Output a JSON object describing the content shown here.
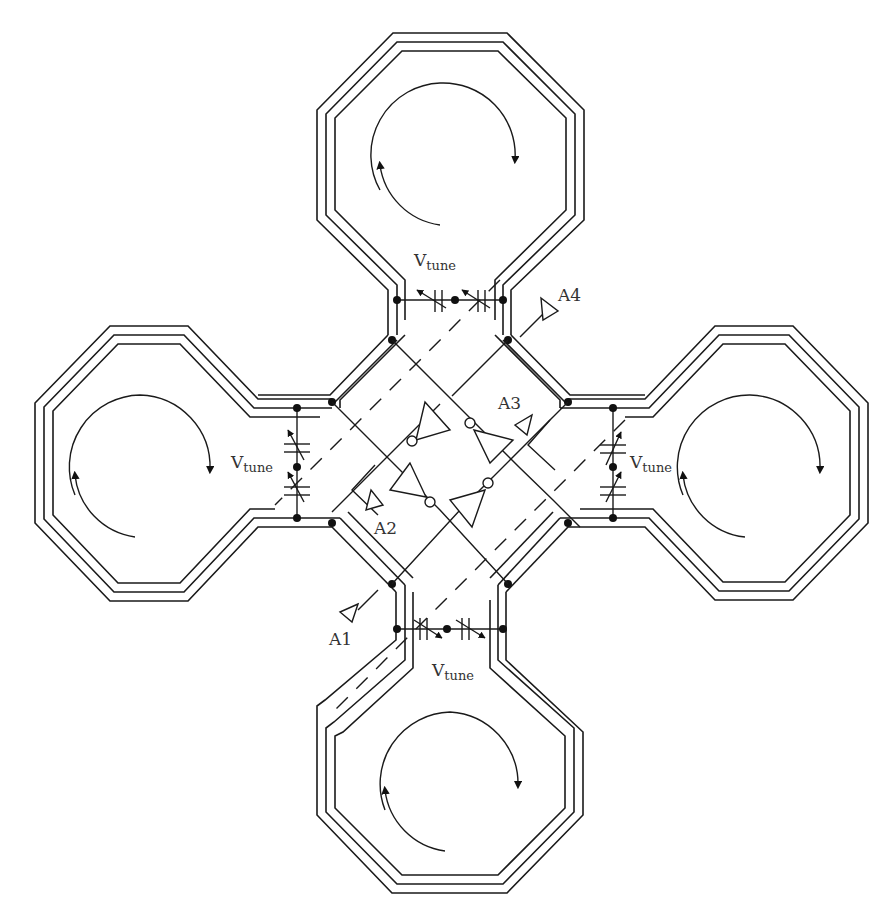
{
  "figure": {
    "colors": {
      "line": "#1a1a1a",
      "text": "#333333",
      "background": "#ffffff"
    }
  },
  "labels": {
    "vtune_symbol": "V",
    "vtune_sub": "tune",
    "antennas": [
      "A1",
      "A2",
      "A3",
      "A4"
    ]
  },
  "inductors": [
    {
      "position": "top",
      "current_direction": "clockwise"
    },
    {
      "position": "left",
      "current_direction": "clockwise"
    },
    {
      "position": "right",
      "current_direction": "clockwise"
    },
    {
      "position": "bottom",
      "current_direction": "clockwise"
    }
  ],
  "varactor_pairs": [
    {
      "position": "top"
    },
    {
      "position": "left"
    },
    {
      "position": "right"
    },
    {
      "position": "bottom"
    }
  ],
  "inverters": {
    "count": 4
  }
}
